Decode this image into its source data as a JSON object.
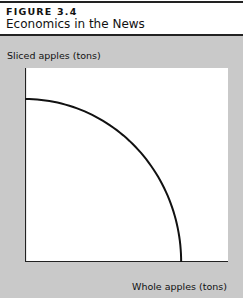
{
  "figure": {
    "label": "FIGURE 3.4",
    "title": "Economics in the News"
  },
  "chart_data": {
    "type": "line",
    "title": "",
    "xlabel": "Whole apples (tons)",
    "ylabel": "Sliced apples (tons)",
    "grid": false,
    "legend": null,
    "series": [
      {
        "name": "Production possibilities frontier",
        "x": [
          0,
          0.2,
          0.4,
          0.6,
          0.8,
          0.9,
          1.0
        ],
        "y": [
          0.84,
          0.78,
          0.68,
          0.54,
          0.34,
          0.2,
          0.0
        ]
      }
    ],
    "xlim": [
      0,
      1.3
    ],
    "ylim": [
      0,
      1.0
    ]
  }
}
